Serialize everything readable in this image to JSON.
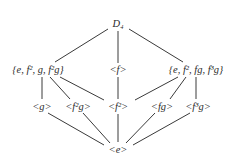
{
  "diagram": {
    "type": "subgroup-lattice",
    "nodes": [
      {
        "id": "D4",
        "label": "D₄",
        "x": 118,
        "y": 24
      },
      {
        "id": "H1",
        "label": "{e, f², g, f²g}",
        "x": 38,
        "y": 70
      },
      {
        "id": "Cf",
        "label": "<f>",
        "x": 118,
        "y": 70
      },
      {
        "id": "H2",
        "label": "{e, f², fg, f³g}",
        "x": 196,
        "y": 70
      },
      {
        "id": "g",
        "label": "<g>",
        "x": 42,
        "y": 107
      },
      {
        "id": "f2g",
        "label": "<f²g>",
        "x": 78,
        "y": 107
      },
      {
        "id": "f2",
        "label": "<f²>",
        "x": 118,
        "y": 107
      },
      {
        "id": "fg",
        "label": "<fg>",
        "x": 162,
        "y": 107
      },
      {
        "id": "f3g",
        "label": "<f³g>",
        "x": 198,
        "y": 107
      },
      {
        "id": "e",
        "label": "<e>",
        "x": 118,
        "y": 150
      }
    ],
    "edges": [
      [
        "D4",
        "H1"
      ],
      [
        "D4",
        "Cf"
      ],
      [
        "D4",
        "H2"
      ],
      [
        "H1",
        "g"
      ],
      [
        "H1",
        "f2g"
      ],
      [
        "H1",
        "f2"
      ],
      [
        "Cf",
        "f2"
      ],
      [
        "H2",
        "f2"
      ],
      [
        "H2",
        "fg"
      ],
      [
        "H2",
        "f3g"
      ],
      [
        "g",
        "e"
      ],
      [
        "f2g",
        "e"
      ],
      [
        "f2",
        "e"
      ],
      [
        "fg",
        "e"
      ],
      [
        "f3g",
        "e"
      ]
    ]
  }
}
